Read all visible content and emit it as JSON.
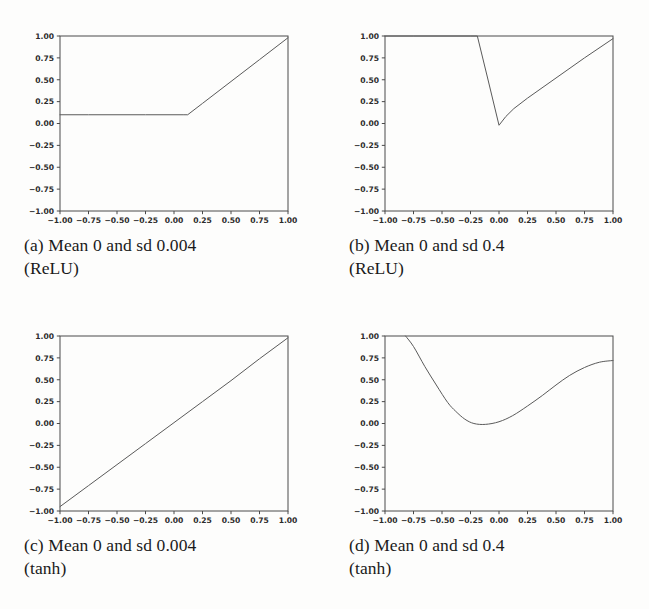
{
  "figure": {
    "background_color": "#fdfdfc",
    "line_color": "#5a5a5a",
    "axis_color": "#4a4a4a",
    "tick_label_color": "#2b2b2b",
    "caption_color": "#1a1a1a"
  },
  "panels": [
    {
      "key": "a",
      "caption_label": "(a)",
      "caption_line1": "Mean 0 and sd 0.004",
      "caption_line2": "(ReLU)",
      "caption_full": "(a) Mean 0 and sd 0.004 (ReLU)"
    },
    {
      "key": "b",
      "caption_label": "(b)",
      "caption_line1": "Mean 0 and sd 0.4",
      "caption_line2": "(ReLU)",
      "caption_full": "(b) Mean 0 and sd 0.4 (ReLU)"
    },
    {
      "key": "c",
      "caption_label": "(c)",
      "caption_line1": "Mean 0 and sd 0.004",
      "caption_line2": "(tanh)",
      "caption_full": "(c) Mean 0 and sd 0.004 (tanh)"
    },
    {
      "key": "d",
      "caption_label": "(d)",
      "caption_line1": "Mean 0 and sd 0.4",
      "caption_line2": "(tanh)",
      "caption_full": "(d) Mean 0 and sd 0.4 (tanh)"
    }
  ],
  "chart_data": [
    {
      "type": "line",
      "panel": "a",
      "title": "(a) Mean 0 and sd 0.004 (ReLU)",
      "xlabel": "",
      "ylabel": "",
      "xlim": [
        -1.0,
        1.0
      ],
      "ylim": [
        -1.0,
        1.0
      ],
      "grid": false,
      "legend": "none",
      "xticks": [
        -1.0,
        -0.75,
        -0.5,
        -0.25,
        0.0,
        0.25,
        0.5,
        0.75,
        1.0
      ],
      "xtick_labels": [
        "-1.00",
        "-0.75",
        "-0.50",
        "-0.25",
        "0.00",
        "0.25",
        "0.50",
        "0.75",
        "1.00"
      ],
      "yticks": [
        -1.0,
        -0.75,
        -0.5,
        -0.25,
        0.0,
        0.25,
        0.5,
        0.75,
        1.0
      ],
      "ytick_labels": [
        "-1.00",
        "-0.75",
        "-0.50",
        "-0.25",
        "0.00",
        "0.25",
        "0.50",
        "0.75",
        "1.00"
      ],
      "series": [
        {
          "name": "relu-sd-0.004",
          "x": [
            -1.0,
            -0.75,
            -0.5,
            -0.25,
            0.0,
            0.08,
            0.12,
            0.25,
            0.5,
            0.75,
            1.0
          ],
          "y": [
            0.1,
            0.1,
            0.1,
            0.1,
            0.1,
            0.1,
            0.1,
            0.23,
            0.48,
            0.73,
            0.98
          ]
        }
      ]
    },
    {
      "type": "line",
      "panel": "b",
      "title": "(b) Mean 0 and sd 0.4 (ReLU)",
      "xlabel": "",
      "ylabel": "",
      "xlim": [
        -1.0,
        1.0
      ],
      "ylim": [
        -1.0,
        1.0
      ],
      "grid": false,
      "legend": "none",
      "xticks": [
        -1.0,
        -0.75,
        -0.5,
        -0.25,
        0.0,
        0.25,
        0.5,
        0.75,
        1.0
      ],
      "xtick_labels": [
        "-1.00",
        "-0.75",
        "-0.50",
        "-0.25",
        "0.00",
        "0.25",
        "0.50",
        "0.75",
        "1.00"
      ],
      "yticks": [
        -1.0,
        -0.75,
        -0.5,
        -0.25,
        0.0,
        0.25,
        0.5,
        0.75,
        1.0
      ],
      "ytick_labels": [
        "-1.00",
        "-0.75",
        "-0.50",
        "-0.25",
        "0.00",
        "0.25",
        "0.50",
        "0.75",
        "1.00"
      ],
      "series": [
        {
          "name": "relu-sd-0.4",
          "x": [
            -1.0,
            -0.75,
            -0.5,
            -0.25,
            -0.19,
            -0.1,
            0.0,
            0.06,
            0.13,
            0.25,
            0.5,
            0.75,
            1.0
          ],
          "y": [
            1.0,
            1.0,
            1.0,
            1.0,
            1.0,
            0.52,
            -0.02,
            0.08,
            0.17,
            0.29,
            0.52,
            0.75,
            0.97
          ]
        }
      ]
    },
    {
      "type": "line",
      "panel": "c",
      "title": "(c) Mean 0 and sd 0.004 (tanh)",
      "xlabel": "",
      "ylabel": "",
      "xlim": [
        -1.0,
        1.0
      ],
      "ylim": [
        -1.0,
        1.0
      ],
      "grid": false,
      "legend": "none",
      "xticks": [
        -1.0,
        -0.75,
        -0.5,
        -0.25,
        0.0,
        0.25,
        0.5,
        0.75,
        1.0
      ],
      "xtick_labels": [
        "-1.00",
        "-0.75",
        "-0.50",
        "-0.25",
        "0.00",
        "0.25",
        "0.50",
        "0.75",
        "1.00"
      ],
      "yticks": [
        -1.0,
        -0.75,
        -0.5,
        -0.25,
        0.0,
        0.25,
        0.5,
        0.75,
        1.0
      ],
      "ytick_labels": [
        "-1.00",
        "-0.75",
        "-0.50",
        "-0.25",
        "0.00",
        "0.25",
        "0.50",
        "0.75",
        "1.00"
      ],
      "series": [
        {
          "name": "tanh-sd-0.004",
          "x": [
            -1.0,
            -0.75,
            -0.5,
            -0.25,
            0.0,
            0.25,
            0.5,
            0.75,
            1.0
          ],
          "y": [
            -0.95,
            -0.71,
            -0.47,
            -0.23,
            0.01,
            0.25,
            0.49,
            0.74,
            0.98
          ]
        }
      ]
    },
    {
      "type": "line",
      "panel": "d",
      "title": "(d) Mean 0 and sd 0.4 (tanh)",
      "xlabel": "",
      "ylabel": "",
      "xlim": [
        -1.0,
        1.0
      ],
      "ylim": [
        -1.0,
        1.0
      ],
      "grid": false,
      "legend": "none",
      "xticks": [
        -1.0,
        -0.75,
        -0.5,
        -0.25,
        0.0,
        0.25,
        0.5,
        0.75,
        1.0
      ],
      "xtick_labels": [
        "-1.00",
        "-0.75",
        "-0.50",
        "-0.25",
        "0.00",
        "0.25",
        "0.50",
        "0.75",
        "1.00"
      ],
      "yticks": [
        -1.0,
        -0.75,
        -0.5,
        -0.25,
        0.0,
        0.25,
        0.5,
        0.75,
        1.0
      ],
      "ytick_labels": [
        "-1.00",
        "-0.75",
        "-0.50",
        "-0.25",
        "0.00",
        "0.25",
        "0.50",
        "0.75",
        "1.00"
      ],
      "series": [
        {
          "name": "tanh-sd-0.4",
          "x": [
            -0.82,
            -0.75,
            -0.65,
            -0.55,
            -0.45,
            -0.38,
            -0.3,
            -0.22,
            -0.12,
            0.0,
            0.12,
            0.25,
            0.38,
            0.5,
            0.62,
            0.75,
            0.88,
            1.0
          ],
          "y": [
            1.0,
            0.88,
            0.65,
            0.44,
            0.24,
            0.14,
            0.05,
            0.0,
            -0.01,
            0.02,
            0.09,
            0.2,
            0.32,
            0.44,
            0.55,
            0.64,
            0.7,
            0.72
          ]
        }
      ]
    }
  ]
}
